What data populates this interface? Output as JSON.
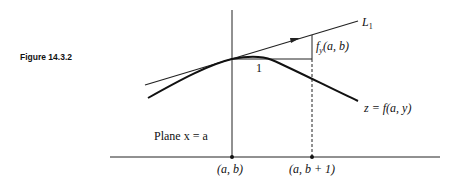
{
  "figure": {
    "caption": "Figure 14.3.2",
    "labels": {
      "tangent_line": "L",
      "tangent_line_sub": "1",
      "slope": "f",
      "slope_sub": "y",
      "slope_args": "(a, b)",
      "run": "1",
      "curve": "z = f(a, y)",
      "plane": "Plane x = a",
      "point_left": "(a, b)",
      "point_right": "(a, b + 1)"
    },
    "colors": {
      "ink": "#111111",
      "background": "#ffffff"
    }
  }
}
